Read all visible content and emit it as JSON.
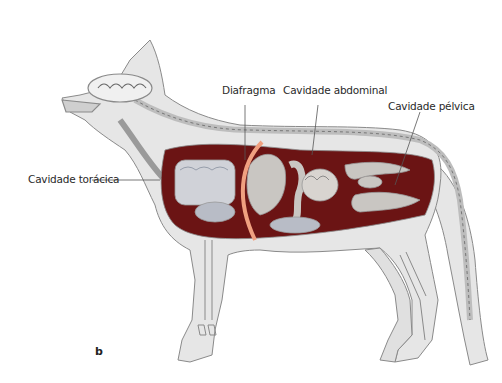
{
  "figure": {
    "panel_letter": "b",
    "labels": {
      "thoracic_cavity": "Cavidade torácica",
      "diaphragm": "Diafragma",
      "abdominal_cavity": "Cavidade abdominal",
      "pelvic_cavity": "Cavidade pélvica"
    },
    "colors": {
      "body_fill": "#e6e6e6",
      "outline": "#8a8a8a",
      "cavity": "#6b1414",
      "organ": "#c9c6c2",
      "diaphragm": "#f0a080",
      "leader_line": "#555555",
      "lung_tint": "#b8bcc6"
    }
  }
}
